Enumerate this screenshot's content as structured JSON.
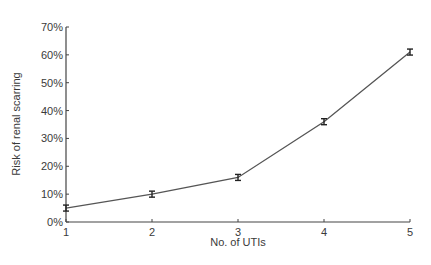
{
  "chart_data": {
    "type": "line",
    "title": "",
    "xlabel": "No. of UTIs",
    "ylabel": "Risk of renal scarring",
    "x": [
      1,
      2,
      3,
      4,
      5
    ],
    "series": [
      {
        "name": "Risk of renal scarring",
        "values": [
          5,
          10,
          16,
          36,
          61
        ],
        "error_bars": true
      }
    ],
    "xticks": [
      "1",
      "2",
      "3",
      "4",
      "5"
    ],
    "yticks": [
      "0%",
      "10%",
      "20%",
      "30%",
      "40%",
      "50%",
      "60%",
      "70%"
    ],
    "xlim": [
      1,
      5
    ],
    "ylim": [
      0,
      70
    ],
    "grid": false,
    "legend": null
  },
  "colors": {
    "line": "#555555",
    "axis": "#444444"
  }
}
